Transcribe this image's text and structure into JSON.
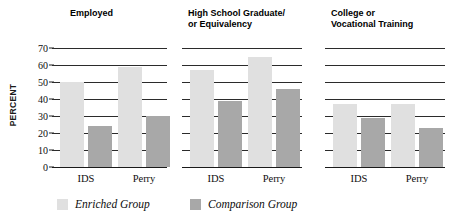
{
  "chart_data": {
    "type": "bar",
    "title": "",
    "subtitle": "",
    "xlabel": "",
    "ylabel": "PERCENT",
    "ylim": [
      0,
      70
    ],
    "yticks": [
      0,
      10,
      20,
      30,
      40,
      50,
      60,
      70
    ],
    "ytick_labels": [
      "0",
      "10",
      "20",
      "30",
      "40",
      "50",
      "60",
      "70"
    ],
    "grid": true,
    "legend_position": "bottom",
    "categories": [
      "IDS",
      "Perry"
    ],
    "series": [
      {
        "name": "Enriched Group",
        "color": "#e0e0e0"
      },
      {
        "name": "Comparison Group",
        "color": "#a8a8a8"
      }
    ],
    "panels": [
      {
        "title": "Employed",
        "groups": [
          {
            "category": "IDS",
            "enriched": 50,
            "comparison": 24
          },
          {
            "category": "Perry",
            "enriched": 59,
            "comparison": 30
          }
        ]
      },
      {
        "title": "High School Graduate/\nor Equivalency",
        "groups": [
          {
            "category": "IDS",
            "enriched": 57,
            "comparison": 39
          },
          {
            "category": "Perry",
            "enriched": 65,
            "comparison": 46
          }
        ]
      },
      {
        "title": "College or\nVocational Training",
        "groups": [
          {
            "category": "IDS",
            "enriched": 37,
            "comparison": 29
          },
          {
            "category": "Perry",
            "enriched": 37,
            "comparison": 23
          }
        ]
      }
    ]
  },
  "legend": {
    "items": [
      {
        "label": "Enriched Group",
        "swatch": "enriched"
      },
      {
        "label": "Comparison Group",
        "swatch": "comparison"
      }
    ]
  },
  "colors": {
    "enriched": "#e0e0e0",
    "comparison": "#a8a8a8",
    "gridline": "#2b2b2b",
    "text": "#0d0d0d",
    "background": "#ffffff"
  }
}
